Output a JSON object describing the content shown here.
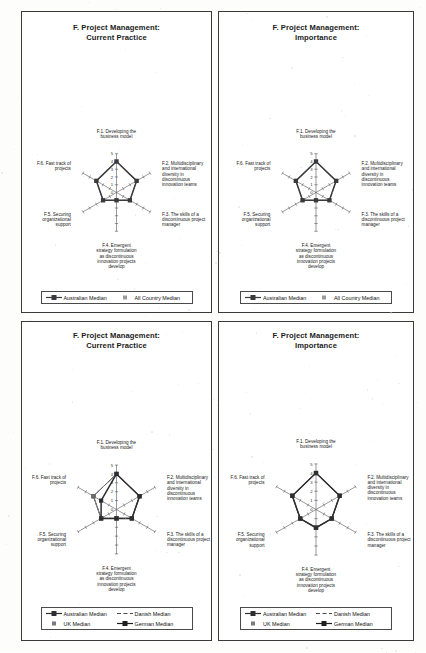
{
  "page": {
    "background_color": "#fdfdfc",
    "panel_border_color": "#3a3a3a"
  },
  "axes_labels": {
    "f1": "F.1. Developing the\nbusiness model",
    "f2": "F.2. Multidisciplinary\nand international\ndiversity in\ndiscontinuous\ninnovation teams",
    "f3": "F.3.  The skills of a\ndiscontinuous project\nmanager",
    "f4": "F.4.  Emergent\nstrategy formulation\nas discontinuous\ninnovation projects\ndevelop",
    "f5": "F.5. Securing\norganizational\nsupport",
    "f6": "F.6. Fast track of\nprojects"
  },
  "tick_labels": [
    "5",
    "4",
    "3",
    "2",
    "1",
    "0"
  ],
  "panels": [
    {
      "id": "top-left",
      "title": "F. Project Management:\nCurrent Practice",
      "legend": [
        {
          "label": "Australian Median",
          "key": "line-marker-square",
          "color": "#3a3a3a"
        },
        {
          "label": "All Country Median",
          "key": "marker-square",
          "color": "#9a9a9a"
        }
      ],
      "chart_data": {
        "type": "radar",
        "title": "F. Project Management: Current Practice",
        "categories": [
          "F.1. Developing the business model",
          "F.2. Multidisciplinary and international diversity in discontinuous innovation teams",
          "F.3.  The skills of a discontinuous project manager",
          "F.4.  Emergent strategy formulation as discontinuous innovation projects develop",
          "F.5. Securing organizational support",
          "F.6. Fast track of projects"
        ],
        "rlim": [
          0,
          5
        ],
        "rticks": [
          0,
          1,
          2,
          3,
          4,
          5
        ],
        "grid": true,
        "legend_position": "bottom",
        "series": [
          {
            "name": "Australian Median",
            "color": "#3a3a3a",
            "values": [
              4,
              3,
              2,
              1,
              2,
              3
            ]
          },
          {
            "name": "All Country Median",
            "color": "#9a9a9a",
            "values": [
              4,
              3,
              2,
              1,
              2,
              3
            ]
          }
        ]
      }
    },
    {
      "id": "top-right",
      "title": "F. Project Management:\nImportance",
      "legend": [
        {
          "label": "Australian Median",
          "key": "line-marker-square",
          "color": "#3a3a3a"
        },
        {
          "label": "All Country Median",
          "key": "marker-square",
          "color": "#9a9a9a"
        }
      ],
      "chart_data": {
        "type": "radar",
        "title": "F. Project Management: Importance",
        "categories": [
          "F.1. Developing the business model",
          "F.2. Multidisciplinary and international diversity in discontinuous innovation teams",
          "F.3.  The skills of a discontinuous project manager",
          "F.4.  Emergent strategy formulation as discontinuous innovation projects develop",
          "F.5. Securing organizational support",
          "F.6. Fast track of projects"
        ],
        "rlim": [
          0,
          5
        ],
        "rticks": [
          0,
          1,
          2,
          3,
          4,
          5
        ],
        "grid": true,
        "legend_position": "bottom",
        "series": [
          {
            "name": "Australian Median",
            "color": "#3a3a3a",
            "values": [
              4,
              3,
              2,
              1,
              2,
              3
            ]
          },
          {
            "name": "All Country Median",
            "color": "#9a9a9a",
            "values": [
              4,
              3,
              2,
              1,
              2,
              3
            ]
          }
        ]
      }
    },
    {
      "id": "bottom-left",
      "title": "F. Project Management:\nCurrent Practice",
      "legend": [
        {
          "label": "Australian Median",
          "key": "line-marker-square",
          "color": "#2e2e2e"
        },
        {
          "label": "Danish Median",
          "key": "dashed-line",
          "color": "#4a4a4a"
        },
        {
          "label": "UK Median",
          "key": "marker-square",
          "color": "#7a7a7a"
        },
        {
          "label": "German Median",
          "key": "line-marker-square",
          "color": "#1f1f1f"
        }
      ],
      "chart_data": {
        "type": "radar",
        "title": "F. Project Management: Current Practice",
        "categories": [
          "F.1. Developing the business model",
          "F.2. Multidisciplinary and international diversity in discontinuous innovation teams",
          "F.3.  The skills of a discontinuous project manager",
          "F.4.  Emergent strategy formulation as discontinuous innovation projects develop",
          "F.5. Securing organizational support",
          "F.6. Fast track of projects"
        ],
        "rlim": [
          0,
          5
        ],
        "rticks": [
          0,
          1,
          2,
          3,
          4,
          5
        ],
        "grid": true,
        "legend_position": "bottom",
        "series": [
          {
            "name": "Australian Median",
            "color": "#2e2e2e",
            "values": [
              4,
              3,
              2,
              1,
              2,
              2
            ]
          },
          {
            "name": "Danish Median",
            "color": "#6a6a6a",
            "values": [
              4,
              3,
              2,
              1,
              2,
              3
            ]
          },
          {
            "name": "UK Median",
            "color": "#8d8d8d",
            "values": [
              4,
              3,
              2,
              1,
              2,
              3
            ]
          },
          {
            "name": "German Median",
            "color": "#1f1f1f",
            "values": [
              4,
              3,
              2,
              1,
              2,
              3
            ]
          }
        ]
      }
    },
    {
      "id": "bottom-right",
      "title": "F. Project Management:\nImportance",
      "legend": [
        {
          "label": "Australian Median",
          "key": "line-marker-square",
          "color": "#2e2e2e"
        },
        {
          "label": "Danish Median",
          "key": "dashed-line",
          "color": "#4a4a4a"
        },
        {
          "label": "UK Median",
          "key": "marker-square",
          "color": "#7a7a7a"
        },
        {
          "label": "German Median",
          "key": "line-marker-square",
          "color": "#1f1f1f"
        }
      ],
      "chart_data": {
        "type": "radar",
        "title": "F. Project Management: Importance",
        "categories": [
          "F.1. Developing the business model",
          "F.2. Multidisciplinary and international diversity in discontinuous innovation teams",
          "F.3.  The skills of a discontinuous project manager",
          "F.4.  Emergent strategy formulation as discontinuous innovation projects develop",
          "F.5. Securing organizational support",
          "F.6. Fast track of projects"
        ],
        "rlim": [
          0,
          5
        ],
        "rticks": [
          0,
          1,
          2,
          3,
          4,
          5
        ],
        "grid": true,
        "legend_position": "bottom",
        "series": [
          {
            "name": "Australian Median",
            "color": "#2e2e2e",
            "values": [
              4,
              3,
              2,
              2,
              2,
              3
            ]
          },
          {
            "name": "Danish Median",
            "color": "#6a6a6a",
            "values": [
              4,
              3,
              2,
              2,
              2,
              3
            ]
          },
          {
            "name": "UK Median",
            "color": "#8d8d8d",
            "values": [
              4,
              3,
              2,
              2,
              2,
              3
            ]
          },
          {
            "name": "German Median",
            "color": "#1f1f1f",
            "values": [
              4,
              3,
              2,
              2,
              2,
              3
            ]
          }
        ]
      }
    }
  ]
}
